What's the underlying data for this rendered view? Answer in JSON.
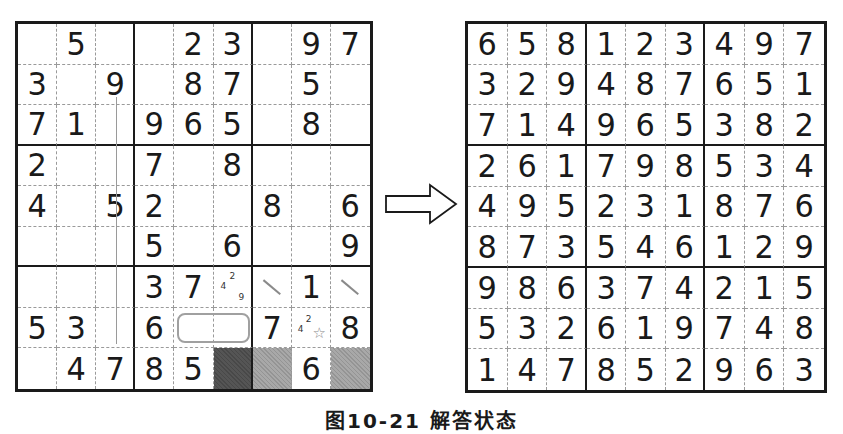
{
  "left_grid": {
    "label": "puzzle-in-progress",
    "rows": [
      [
        "",
        "5",
        "",
        "",
        "2",
        "3",
        "",
        "9",
        "7"
      ],
      [
        "3",
        "",
        "9",
        "",
        "8",
        "7",
        "",
        "5",
        ""
      ],
      [
        "7",
        "1",
        "",
        "9",
        "6",
        "5",
        "",
        "8",
        ""
      ],
      [
        "2",
        "",
        "",
        "7",
        "",
        "8",
        "",
        "",
        ""
      ],
      [
        "4",
        "",
        "5",
        "2",
        "",
        "",
        "8",
        "",
        "6"
      ],
      [
        "",
        "",
        "",
        "5",
        "",
        "6",
        "",
        "",
        "9"
      ],
      [
        "",
        "",
        "",
        "3",
        "7",
        "",
        "",
        "1",
        ""
      ],
      [
        "5",
        "3",
        "",
        "6",
        "",
        "",
        "7",
        "",
        "8"
      ],
      [
        "",
        "4",
        "7",
        "8",
        "5",
        "",
        "",
        "6",
        ""
      ]
    ],
    "annotations": {
      "pencil_marks": [
        {
          "row": 6,
          "col": 5,
          "marks": [
            "4",
            "2",
            "9"
          ]
        },
        {
          "row": 7,
          "col": 7,
          "marks": [
            "4",
            "2"
          ],
          "symbol": "star"
        }
      ],
      "slash_marks": [
        {
          "row": 6,
          "col": 6
        },
        {
          "row": 6,
          "col": 8
        }
      ],
      "selection_box": {
        "row": 7,
        "cols": [
          4,
          5
        ]
      },
      "shaded_cells": [
        {
          "row": 8,
          "col": 5,
          "shade": "dark"
        },
        {
          "row": 8,
          "col": 6,
          "shade": "medium"
        },
        {
          "row": 8,
          "col": 8,
          "shade": "medium"
        }
      ],
      "guide_line": {
        "col": 2,
        "from_row": 1,
        "to_row": 7
      }
    }
  },
  "arrow": {
    "icon": "right-arrow-icon"
  },
  "right_grid": {
    "label": "solved-puzzle",
    "rows": [
      [
        "6",
        "5",
        "8",
        "1",
        "2",
        "3",
        "4",
        "9",
        "7"
      ],
      [
        "3",
        "2",
        "9",
        "4",
        "8",
        "7",
        "6",
        "5",
        "1"
      ],
      [
        "7",
        "1",
        "4",
        "9",
        "6",
        "5",
        "3",
        "8",
        "2"
      ],
      [
        "2",
        "6",
        "1",
        "7",
        "9",
        "8",
        "5",
        "3",
        "4"
      ],
      [
        "4",
        "9",
        "5",
        "2",
        "3",
        "1",
        "8",
        "7",
        "6"
      ],
      [
        "8",
        "7",
        "3",
        "5",
        "4",
        "6",
        "1",
        "2",
        "9"
      ],
      [
        "9",
        "8",
        "6",
        "3",
        "7",
        "4",
        "2",
        "1",
        "5"
      ],
      [
        "5",
        "3",
        "2",
        "6",
        "1",
        "9",
        "7",
        "4",
        "8"
      ],
      [
        "1",
        "4",
        "7",
        "8",
        "5",
        "2",
        "9",
        "6",
        "3"
      ]
    ]
  },
  "caption": "图10-21  解答状态"
}
